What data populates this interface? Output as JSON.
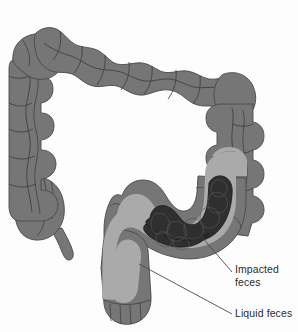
{
  "figure": {
    "background_color": "#fdfdfd"
  },
  "colors": {
    "colon_wall": "#767676",
    "colon_wall_shadow": "#6b6b6b",
    "colon_outline": "#4a4a4a",
    "haustra_line": "#3f3f3f",
    "liquid_feces": "#aaaaaa",
    "impacted_feces": "#2f2f2f",
    "impacted_feces_outline": "#1c1c1c",
    "leader_line": "#4a4a4a",
    "label_text": "#2b2b2b"
  },
  "labels": [
    {
      "id": "impacted-feces",
      "line1": "Impacted",
      "line2": "feces",
      "x": 235,
      "y": 263,
      "leader": {
        "x1": 232,
        "y1": 272,
        "x2": 201,
        "y2": 236
      }
    },
    {
      "id": "liquid-feces",
      "line1": "Liquid feces",
      "line2": "",
      "x": 235,
      "y": 307,
      "leader": {
        "x1": 232,
        "y1": 314,
        "x2": 139,
        "y2": 264
      }
    }
  ],
  "structures": [
    {
      "name": "cecum",
      "label": "Cecum"
    },
    {
      "name": "appendix",
      "label": "Appendix"
    },
    {
      "name": "ascending-colon",
      "label": "Ascending colon"
    },
    {
      "name": "transverse-colon",
      "label": "Transverse colon"
    },
    {
      "name": "descending-colon",
      "label": "Descending colon"
    },
    {
      "name": "sigmoid-colon",
      "label": "Sigmoid colon"
    },
    {
      "name": "rectum",
      "label": "Rectum"
    }
  ]
}
